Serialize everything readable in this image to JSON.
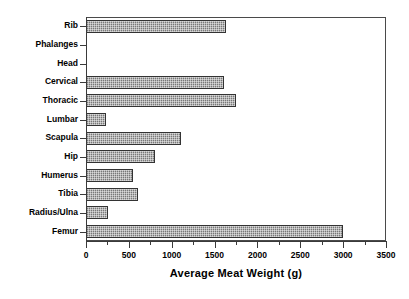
{
  "chart_data": {
    "type": "bar",
    "orientation": "horizontal",
    "title": "",
    "xlabel": "Average Meat Weight (g)",
    "ylabel": "",
    "xlim": [
      0,
      3500
    ],
    "xticks": [
      0,
      500,
      1000,
      1500,
      2000,
      2500,
      3000,
      3500
    ],
    "xtick_labels": [
      "0",
      "500",
      "1000",
      "1500",
      "2000",
      "2500",
      "3000",
      "3500"
    ],
    "minor_xticks": [
      250,
      750,
      1250,
      1750,
      2250,
      2750,
      3250
    ],
    "grid": false,
    "legend": false,
    "categories": [
      "Rib",
      "Phalanges",
      "Head",
      "Cervical",
      "Thoracic",
      "Lumbar",
      "Scapula",
      "Hip",
      "Humerus",
      "Tibia",
      "Radius/Ulna",
      "Femur"
    ],
    "values": [
      1630,
      0,
      0,
      1610,
      1750,
      235,
      1110,
      805,
      550,
      605,
      255,
      3000
    ],
    "bar_fill_color": "#9a9a9a",
    "bar_edge_color": "#333333",
    "axis_color": "#3a3a3a",
    "background_color": "#ffffff"
  }
}
